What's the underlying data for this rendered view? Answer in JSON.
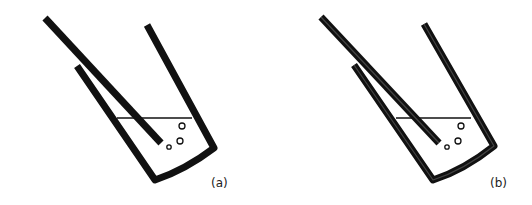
{
  "figure": {
    "panels": [
      {
        "label": "(a)",
        "style": "solid"
      },
      {
        "label": "(b)",
        "style": "outlined"
      }
    ]
  }
}
